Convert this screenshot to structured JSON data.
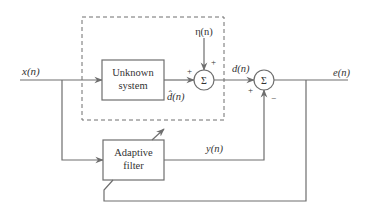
{
  "diagram": {
    "colors": {
      "line": "#6e6e6e",
      "text": "#333333",
      "background": "#ffffff"
    },
    "signals": {
      "input": "x(n)",
      "noise": "η(n)",
      "desired": "d(n)",
      "unknown_output": "d̂(n)",
      "filter_output": "y(n)",
      "error": "e(n)"
    },
    "blocks": {
      "unknown_system": {
        "line1": "Unknown",
        "line2": "system"
      },
      "adaptive_filter": {
        "line1": "Adaptive",
        "line2": "filter"
      }
    },
    "summers": {
      "sum1": {
        "symbol": "Σ",
        "sign_left": "+",
        "sign_top": "+"
      },
      "sum2": {
        "symbol": "Σ",
        "sign_left": "+",
        "sign_bottom": "−"
      }
    }
  }
}
